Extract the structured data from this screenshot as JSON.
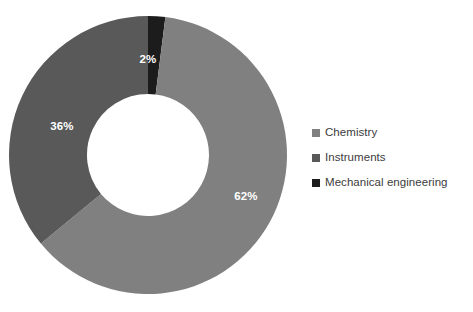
{
  "chart_data": {
    "type": "pie",
    "variant": "donut",
    "title": "",
    "subtitle": "",
    "xlabel": "",
    "ylabel": "",
    "grid": false,
    "legend_position": "right",
    "start_angle_deg": 0,
    "direction": "clockwise",
    "value_unit": "%",
    "categories": [
      "Mechanical engineering",
      "Chemistry",
      "Instruments"
    ],
    "values": [
      2,
      62,
      36
    ],
    "labels": [
      "2%",
      "62%",
      "36%"
    ],
    "colors": [
      "#1c1c1c",
      "#808080",
      "#595959"
    ],
    "slices": [
      {
        "name": "Mechanical engineering",
        "value": 2,
        "label": "2%",
        "color": "#1c1c1c",
        "label_x": 148,
        "label_y": 60
      },
      {
        "name": "Chemistry",
        "value": 62,
        "label": "62%",
        "color": "#808080",
        "label_x": 246,
        "label_y": 197
      },
      {
        "name": "Instruments",
        "value": 36,
        "label": "36%",
        "color": "#595959",
        "label_x": 62,
        "label_y": 127
      }
    ],
    "geometry": {
      "center_x": 148,
      "center_y": 155,
      "outer_radius": 139,
      "inner_radius": 61
    }
  },
  "legend": {
    "items": [
      {
        "label": "Chemistry",
        "color": "#808080"
      },
      {
        "label": "Instruments",
        "color": "#595959"
      },
      {
        "label": "Mechanical engineering",
        "color": "#1c1c1c"
      }
    ]
  },
  "background_color": "#ffffff"
}
